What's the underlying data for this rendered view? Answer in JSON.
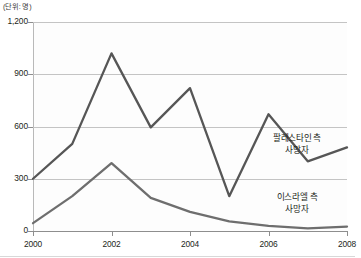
{
  "chart_data": {
    "type": "line",
    "title": "",
    "unit_label": "(단위: 명)",
    "xlabel": "",
    "ylabel": "",
    "x": [
      2000,
      2001,
      2002,
      2003,
      2004,
      2005,
      2006,
      2007,
      2008
    ],
    "xtick_labels": [
      "2000",
      "2002",
      "2004",
      "2006",
      "2008"
    ],
    "xtick_values": [
      2000,
      2002,
      2004,
      2006,
      2008
    ],
    "ytick_labels": [
      "0",
      "300",
      "600",
      "900",
      "1,200"
    ],
    "ytick_values": [
      0,
      300,
      600,
      900,
      1200
    ],
    "ylim": [
      0,
      1200
    ],
    "xlim": [
      2000,
      2008
    ],
    "grid": true,
    "legend_position": "inline-annotations",
    "series": [
      {
        "name": "팔레스타인 측 사망자",
        "color": "#565656",
        "values": [
          300,
          500,
          1020,
          595,
          820,
          200,
          670,
          400,
          480
        ]
      },
      {
        "name": "이스라엘 측 사망자",
        "color": "#6e6e6e",
        "values": [
          45,
          200,
          390,
          190,
          110,
          55,
          30,
          15,
          25
        ]
      }
    ],
    "annotations": [
      {
        "id": "palestinian",
        "line1": "팔레스타인 측",
        "line2": "사망자"
      },
      {
        "id": "israeli",
        "line1": "이스라엘 측",
        "line2": "사망자"
      }
    ]
  },
  "colors": {
    "series_primary": "#565656",
    "series_secondary": "#6e6e6e",
    "grid": "#c4c4c4",
    "axis": "#8e8e8e",
    "text": "#231f20",
    "plot_background": "#fdfdfd"
  }
}
